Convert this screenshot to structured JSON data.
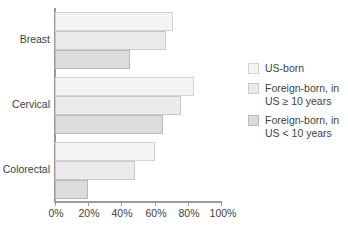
{
  "chart_data": {
    "type": "bar",
    "orientation": "horizontal",
    "title": "",
    "subtitle": "",
    "xlabel": "",
    "ylabel": "",
    "xlim": [
      0,
      100
    ],
    "xticks": [
      0,
      20,
      40,
      60,
      80,
      100
    ],
    "xtick_labels": [
      "0%",
      "20%",
      "40%",
      "60%",
      "80%",
      "100%"
    ],
    "grid": false,
    "legend_position": "right",
    "categories": [
      "Breast",
      "Cervical",
      "Colorectal"
    ],
    "series": [
      {
        "name": "US-born",
        "color": "#f4f4f4",
        "border": "#d2d2d2",
        "values": [
          71,
          84,
          60
        ]
      },
      {
        "name": "Foreign-born, in\nUS ≥ 10 years",
        "color": "#ebebeb",
        "border": "#c9c9c9",
        "values": [
          67,
          76,
          48
        ]
      },
      {
        "name": "Foreign-born, in\nUS < 10 years",
        "color": "#dcdcdc",
        "border": "#b9b9b9",
        "values": [
          45,
          65,
          20
        ]
      }
    ]
  },
  "axis": {
    "line_color": "#9a9a9a",
    "tick_0": "0%",
    "tick_1": "20%",
    "tick_2": "40%",
    "tick_3": "60%",
    "tick_4": "80%",
    "tick_5": "100%"
  },
  "categories": {
    "c0": "Breast",
    "c1": "Cervical",
    "c2": "Colorectal"
  },
  "legend": {
    "item_0": "US-born",
    "item_1": "Foreign-born, in\nUS ≥ 10 years",
    "item_2": "Foreign-born, in\nUS < 10 years"
  }
}
